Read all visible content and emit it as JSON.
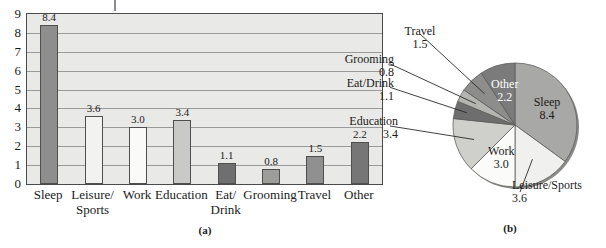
{
  "figure": {
    "panel_a_caption": "(a)",
    "panel_b_caption": "(b)"
  },
  "chart_data": [
    {
      "type": "bar",
      "panel": "(a)",
      "title": "",
      "xlabel": "",
      "ylabel": "",
      "ylim": [
        0,
        9
      ],
      "yticks": [
        "0",
        "1",
        "2",
        "3",
        "4",
        "5",
        "6",
        "7",
        "8",
        "9"
      ],
      "grid": true,
      "legend": "none",
      "plot_background": "#e9e9e7",
      "categories": [
        "Sleep",
        "Leisure/\nSports",
        "Work",
        "Education",
        "Eat/\nDrink",
        "Grooming",
        "Travel",
        "Other"
      ],
      "values": [
        8.4,
        3.6,
        3.0,
        3.4,
        1.1,
        0.8,
        1.5,
        2.2
      ],
      "value_labels": [
        "8.4",
        "3.6",
        "3.0",
        "3.4",
        "1.1",
        "0.8",
        "1.5",
        "2.2"
      ],
      "bar_colors": [
        "#8e8e8e",
        "#f2f2f0",
        "#fafaf8",
        "#c9c9c6",
        "#6f6f6f",
        "#9d9d9a",
        "#909090",
        "#767676"
      ]
    },
    {
      "type": "pie",
      "panel": "(b)",
      "title": "",
      "legend": "labels-on-slices-and-callouts",
      "total": 24.0,
      "slices": [
        {
          "label": "Sleep",
          "value": 8.4,
          "value_label": "8.4",
          "color": "#a8a8a6",
          "label_placement": "inside"
        },
        {
          "label": "Leisure/Sports",
          "value": 3.6,
          "value_label": "3.6",
          "color": "#f0f0ee",
          "label_placement": "callout"
        },
        {
          "label": "Work",
          "value": 3.0,
          "value_label": "3.0",
          "color": "#fbfbf9",
          "label_placement": "inside"
        },
        {
          "label": "Education",
          "value": 3.4,
          "value_label": "3.4",
          "color": "#cfcfcc",
          "label_placement": "callout"
        },
        {
          "label": "Eat/Drink",
          "value": 1.1,
          "value_label": "1.1",
          "color": "#6e6e6e",
          "label_placement": "callout"
        },
        {
          "label": "Grooming",
          "value": 0.8,
          "value_label": "0.8",
          "color": "#b4b4b1",
          "label_placement": "callout"
        },
        {
          "label": "Travel",
          "value": 1.5,
          "value_label": "1.5",
          "color": "#8d8d8b",
          "label_placement": "callout"
        },
        {
          "label": "Other",
          "value": 2.2,
          "value_label": "2.2",
          "color": "#7b7b7b",
          "label_placement": "inside"
        }
      ]
    }
  ]
}
